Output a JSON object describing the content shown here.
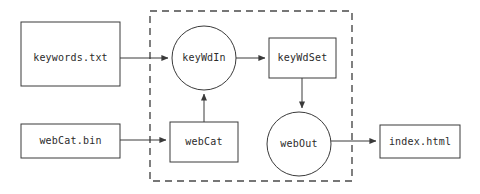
{
  "diagram": {
    "type": "dataflow-diagram",
    "title": "",
    "canvas": {
      "width": 480,
      "height": 194,
      "background": "#ffffff"
    },
    "colors": {
      "stroke": "#3a3a3a",
      "group_stroke": "#4a4a4a",
      "node_fill": "#ffffff",
      "text": "#2b2b2b"
    },
    "group": {
      "name": "process-boundary",
      "label": "",
      "style": "dashed",
      "x": 150,
      "y": 11,
      "width": 202,
      "height": 170
    },
    "nodes": [
      {
        "id": "keywords-txt",
        "label": "keywords.txt",
        "shape": "rect",
        "x": 21,
        "y": 22,
        "width": 99,
        "height": 64,
        "inside_group": false
      },
      {
        "id": "key-wd-in",
        "label": "keyWdIn",
        "shape": "circle",
        "cx": 204,
        "cy": 58,
        "r": 32,
        "inside_group": true
      },
      {
        "id": "key-wd-set",
        "label": "keyWdSet",
        "shape": "rect",
        "x": 269,
        "y": 38,
        "width": 67,
        "height": 40,
        "inside_group": true
      },
      {
        "id": "web-cat-bin",
        "label": "webCat.bin",
        "shape": "rect",
        "x": 21,
        "y": 124,
        "width": 99,
        "height": 34,
        "inside_group": false
      },
      {
        "id": "web-cat",
        "label": "webCat",
        "shape": "rect",
        "x": 170,
        "y": 122,
        "width": 68,
        "height": 40,
        "inside_group": true
      },
      {
        "id": "web-out",
        "label": "webOut",
        "shape": "circle",
        "cx": 299,
        "cy": 144,
        "r": 32,
        "inside_group": true
      },
      {
        "id": "index-html",
        "label": "index.html",
        "shape": "rect",
        "x": 380,
        "y": 125,
        "width": 80,
        "height": 33,
        "inside_group": false
      }
    ],
    "edges": [
      {
        "id": "edge-keywords-to-keywdin",
        "from": "keywords-txt",
        "to": "key-wd-in",
        "direction": "right",
        "arrow": true
      },
      {
        "id": "edge-keywdin-to-keywdset",
        "from": "key-wd-in",
        "to": "key-wd-set",
        "direction": "right",
        "arrow": true
      },
      {
        "id": "edge-keywdset-to-webout",
        "from": "key-wd-set",
        "to": "web-out",
        "direction": "down",
        "arrow": true
      },
      {
        "id": "edge-webcatbin-to-webcat",
        "from": "web-cat-bin",
        "to": "web-cat",
        "direction": "right",
        "arrow": true
      },
      {
        "id": "edge-webcat-to-keywdin",
        "from": "web-cat",
        "to": "key-wd-in",
        "direction": "up",
        "arrow": true
      },
      {
        "id": "edge-webout-to-index",
        "from": "web-out",
        "to": "index-html",
        "direction": "right",
        "arrow": true
      }
    ]
  }
}
